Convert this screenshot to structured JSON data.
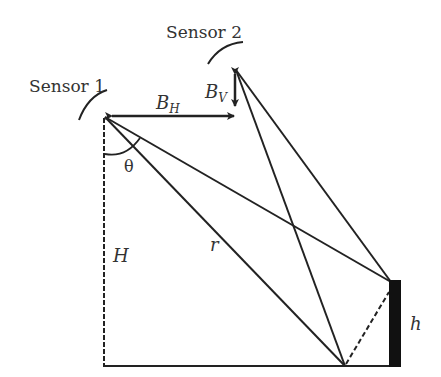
{
  "diagram": {
    "sensor1_label": "Sensor 1",
    "sensor2_label": "Sensor 2",
    "bh_base": "B",
    "bh_sub": "H",
    "bv_base": "B",
    "bv_sub": "V",
    "theta_label": "θ",
    "H_label": "H",
    "r_label": "r",
    "h_label": "h",
    "line_color": "#222222"
  }
}
